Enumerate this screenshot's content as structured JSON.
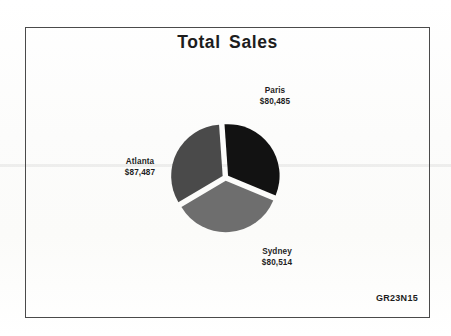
{
  "frame": {
    "border_color": "#4a4a4a"
  },
  "header": {
    "title": "Total Sales"
  },
  "footer": {
    "code": "GR23N15"
  },
  "labels": {
    "paris": {
      "name": "Paris",
      "value": "$80,485"
    },
    "atlanta": {
      "name": "Atlanta",
      "value": "$87,487"
    },
    "sydney": {
      "name": "Sydney",
      "value": "$80,514"
    }
  },
  "colors": {
    "paris_slice": "#121212",
    "atlanta_slice": "#6e6e6e",
    "sydney_slice": "#4a4a4a",
    "text": "#1d1d1d",
    "page": "#fdfdfc"
  },
  "chart_data": {
    "type": "pie",
    "title": "Total Sales",
    "xlabel": "",
    "ylabel": "",
    "grid": false,
    "legend_position": "none",
    "labels_mode": "outside-callout",
    "exploded": true,
    "total": 248486,
    "categories": [
      "Paris",
      "Atlanta",
      "Sydney"
    ],
    "values": [
      80485,
      87487,
      80514
    ],
    "value_labels": [
      "$80,485",
      "$87,487",
      "$80,514"
    ],
    "percentages": [
      32.4,
      35.2,
      32.4
    ],
    "slice_colors": [
      "#121212",
      "#6e6e6e",
      "#4a4a4a"
    ],
    "start_angle_deg": -4,
    "sweep_angles_deg": [
      116.6,
      126.8,
      116.6
    ],
    "annotations": [
      "GR23N15"
    ]
  }
}
